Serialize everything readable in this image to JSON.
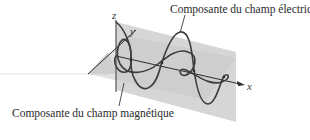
{
  "figure": {
    "labels": {
      "electric_field": "Composante du champ électrique",
      "magnetic_field": "Composante du champ magnétique"
    },
    "axes": {
      "x": "x",
      "y": "y",
      "z": "z"
    },
    "colors": {
      "plane_fill": "#d4d4d4",
      "plane_fill_light": "#e2e2e2",
      "wave_stroke": "#3c3c3c",
      "axis_stroke": "#2c2c2c",
      "text": "#2a2a2a"
    }
  }
}
